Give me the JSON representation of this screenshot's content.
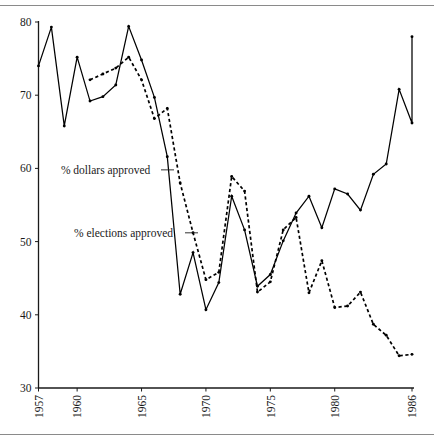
{
  "figure": {
    "has_top_rule": true,
    "has_bottom_rule": true,
    "rule_color": "#8a8a8a",
    "background": "#ffffff"
  },
  "chart_data": {
    "type": "line",
    "title": "",
    "xlabel": "",
    "ylabel": "",
    "xlim": [
      1957,
      1986
    ],
    "ylim": [
      30,
      80
    ],
    "ytick_labels": [
      "30",
      "40",
      "50",
      "60",
      "70",
      "80"
    ],
    "yticks": [
      30,
      40,
      50,
      60,
      70,
      80
    ],
    "xtick_labels": [
      "1957",
      "1960",
      "1965",
      "1970",
      "1975",
      "1980",
      "1986"
    ],
    "xticks": [
      1957,
      1960,
      1965,
      1970,
      1975,
      1980,
      1986
    ],
    "grid": false,
    "legend_position": "inline-annotation",
    "x": [
      1957,
      1958,
      1959,
      1960,
      1961,
      1962,
      1963,
      1964,
      1965,
      1966,
      1967,
      1968,
      1969,
      1970,
      1971,
      1972,
      1973,
      1974,
      1975,
      1976,
      1977,
      1978,
      1979,
      1980,
      1981,
      1982,
      1983,
      1984,
      1985,
      1986
    ],
    "series": [
      {
        "name": "% dollars approved",
        "style": "solid",
        "marker": "dot",
        "values": [
          74.0,
          79.3,
          65.8,
          75.2,
          69.2,
          69.8,
          71.4,
          79.4,
          74.8,
          69.7,
          61.6,
          42.8,
          48.5,
          40.7,
          44.4,
          56.2,
          51.6,
          43.9,
          45.5,
          50.1,
          53.9,
          56.2,
          51.9,
          57.2,
          56.5,
          54.3,
          59.2,
          60.6,
          70.8,
          66.2
        ]
      },
      {
        "name": "% elections approved",
        "style": "dashed",
        "marker": "dot",
        "values": [
          null,
          null,
          null,
          null,
          72.1,
          72.9,
          73.7,
          75.2,
          72.1,
          66.8,
          68.2,
          58.0,
          51.2,
          44.8,
          45.8,
          58.9,
          56.9,
          43.1,
          44.5,
          51.6,
          53.3,
          43.0,
          47.4,
          41.0,
          41.2,
          43.1,
          38.7,
          37.2,
          34.4,
          34.6
        ]
      }
    ],
    "solid_tail": {
      "comment": "solid series final segment continues to 1986",
      "x": [
        1985,
        1986
      ],
      "values": [
        66.2,
        78.0
      ]
    },
    "annotations": [
      {
        "text": "% dollars approved",
        "target_series": "% dollars approved",
        "x": 1957.5,
        "y": 59.8
      },
      {
        "text": "% elections approved",
        "target_series": "% elections approved",
        "x": 1957.5,
        "y": 51.2
      }
    ]
  }
}
